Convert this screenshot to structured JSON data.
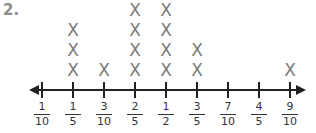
{
  "problem_number": "2.",
  "chart_data": {
    "type": "line plot (dot plot with X marks)",
    "title": "",
    "xlabel": "",
    "ylabel": "",
    "categories": [
      "1/10",
      "1/5",
      "3/10",
      "2/5",
      "1/2",
      "3/5",
      "7/10",
      "4/5",
      "9/10"
    ],
    "tick_labels": [
      {
        "num": "1",
        "den": "10"
      },
      {
        "num": "1",
        "den": "5"
      },
      {
        "num": "3",
        "den": "10"
      },
      {
        "num": "2",
        "den": "5"
      },
      {
        "num": "1",
        "den": "2"
      },
      {
        "num": "3",
        "den": "5"
      },
      {
        "num": "7",
        "den": "10"
      },
      {
        "num": "4",
        "den": "5"
      },
      {
        "num": "9",
        "den": "10"
      }
    ],
    "values": [
      0,
      3,
      1,
      4,
      4,
      2,
      0,
      0,
      1
    ],
    "marker": "X",
    "axis_arrows": "both ends",
    "grid": false
  },
  "colors": {
    "marker": "#7a7a7a",
    "axis": "#222222",
    "number": "#8c8c8c"
  }
}
